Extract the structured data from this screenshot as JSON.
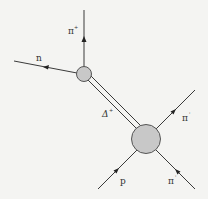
{
  "diagram": {
    "type": "particle-interaction",
    "labels": {
      "pion_top": "π",
      "pion_top_charge": "+",
      "neutron": "n",
      "delta": "Δ",
      "delta_charge": "+",
      "pion_right_out": "π",
      "pion_right_out_charge": "'",
      "proton": "p",
      "pion_right_in": "π",
      "pion_right_in_charge": "'"
    },
    "colors": {
      "line": "#3a3a3a",
      "vertex_fill": "#c8c8c8",
      "background": "#f4f4f2"
    }
  }
}
